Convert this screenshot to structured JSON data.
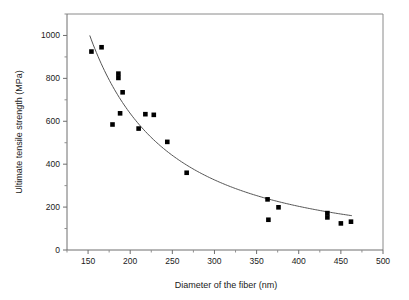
{
  "chart_data": {
    "type": "scatter",
    "title": "",
    "xlabel": "Diameter of the fiber (nm)",
    "ylabel": "Ultimate tensile strength (MPa)",
    "xlim": [
      125,
      500
    ],
    "ylim": [
      0,
      1100
    ],
    "xticks": [
      150,
      200,
      250,
      300,
      350,
      400,
      450,
      500
    ],
    "xtick_labels": [
      "150",
      "200",
      "250",
      "300",
      "350",
      "400",
      "450",
      "500"
    ],
    "yticks": [
      0,
      200,
      400,
      600,
      800,
      1000
    ],
    "ytick_labels": [
      "0",
      "200",
      "400",
      "600",
      "800",
      "1000"
    ],
    "y_minor_ticks": [
      100,
      300,
      500,
      700,
      900,
      1100
    ],
    "grid": false,
    "legend": null,
    "marker": "square",
    "marker_color": "#000000",
    "points": [
      {
        "x": 154,
        "y": 925
      },
      {
        "x": 166,
        "y": 945
      },
      {
        "x": 179,
        "y": 585
      },
      {
        "x": 186,
        "y": 822
      },
      {
        "x": 186,
        "y": 802
      },
      {
        "x": 188,
        "y": 637
      },
      {
        "x": 191,
        "y": 735
      },
      {
        "x": 210,
        "y": 566
      },
      {
        "x": 218,
        "y": 633
      },
      {
        "x": 228,
        "y": 630
      },
      {
        "x": 244,
        "y": 504
      },
      {
        "x": 267,
        "y": 360
      },
      {
        "x": 363,
        "y": 236
      },
      {
        "x": 364,
        "y": 141
      },
      {
        "x": 376,
        "y": 199
      },
      {
        "x": 434,
        "y": 172
      },
      {
        "x": 434,
        "y": 152
      },
      {
        "x": 450,
        "y": 124
      },
      {
        "x": 462,
        "y": 132
      }
    ],
    "fit_curve": {
      "description": "monotonically decreasing power-law trend line",
      "x_start": 152,
      "y_start": 1000,
      "x_end": 463,
      "y_end": 160,
      "color": "#555555"
    }
  }
}
